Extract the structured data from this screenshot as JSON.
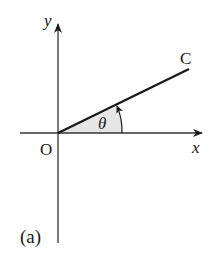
{
  "diagram": {
    "panel_label": "(a)",
    "axes": {
      "x_label": "x",
      "y_label": "y",
      "origin_label": "O"
    },
    "ray": {
      "end_label": "C"
    },
    "angle": {
      "symbol": "θ",
      "fill_color": "#e6e6e6"
    },
    "colors": {
      "ink": "#1a1a1a",
      "axis": "#333333"
    }
  }
}
